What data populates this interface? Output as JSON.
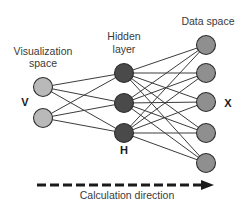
{
  "diagram": {
    "layers": {
      "visualization": {
        "label_line1": "Visualization",
        "label_line2": "space",
        "variable": "V",
        "node_count": 2,
        "fill": "#b9b9b9",
        "nodes": [
          {
            "cx": 43,
            "cy": 87
          },
          {
            "cx": 43,
            "cy": 118
          }
        ]
      },
      "hidden": {
        "label_line1": "Hidden",
        "label_line2": "layer",
        "variable": "H",
        "node_count": 3,
        "fill": "#4a4a4a",
        "nodes": [
          {
            "cx": 124,
            "cy": 73
          },
          {
            "cx": 124,
            "cy": 103
          },
          {
            "cx": 124,
            "cy": 133
          }
        ]
      },
      "data": {
        "label": "Data space",
        "variable": "X",
        "node_count": 5,
        "fill": "#8f8f8f",
        "nodes": [
          {
            "cx": 206,
            "cy": 45
          },
          {
            "cx": 206,
            "cy": 73
          },
          {
            "cx": 206,
            "cy": 102
          },
          {
            "cx": 206,
            "cy": 133
          },
          {
            "cx": 206,
            "cy": 163
          }
        ]
      }
    },
    "connections": "fully-connected",
    "node_radius": 9.5,
    "edge_color": "#3c3c3c",
    "arrow": {
      "label": "Calculation direction",
      "style": "dashed",
      "direction": "left-to-right",
      "color": "#1a1a1a"
    }
  }
}
